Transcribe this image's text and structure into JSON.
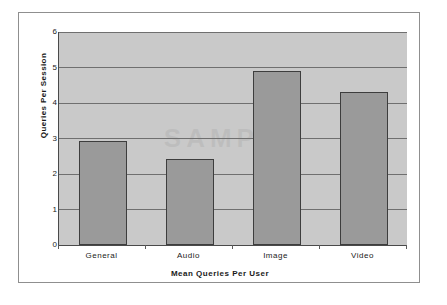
{
  "chart_data": {
    "type": "bar",
    "title": "",
    "subtitle": "",
    "xlabel": "Mean Queries Per User",
    "ylabel": "Queries Per Session",
    "categories": [
      "General",
      "Audio",
      "Image",
      "Video"
    ],
    "values": [
      2.93,
      2.42,
      4.9,
      4.31
    ],
    "series": [
      {
        "name": "Queries Per Session",
        "values": [
          2.93,
          2.42,
          4.9,
          4.31
        ]
      }
    ],
    "ylim": [
      0,
      6
    ],
    "ytick_labels": [
      "0",
      "1",
      "2",
      "3",
      "4",
      "5",
      "6"
    ],
    "ytick_values": [
      0,
      1,
      2,
      3,
      4,
      5,
      6
    ],
    "grid": true,
    "grid_axis": "y",
    "legend": false,
    "legend_position": "none",
    "annotations": [],
    "colors": {
      "bar_fill": "#9a9a9a",
      "bar_border": "#3d3d3d",
      "plot_background": "#c9c9c9",
      "gridline": "#6f6f6f",
      "axis_line": "#4a4a4a",
      "frame_border": "#8f8f8f",
      "page_background": "#ffffff",
      "text": "#1a1a1a"
    }
  },
  "watermark": {
    "text": "SAMPLE"
  }
}
